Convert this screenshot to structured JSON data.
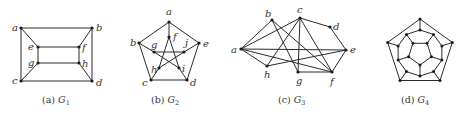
{
  "figure": {
    "panels": [
      {
        "id": "G1",
        "caption_prefix": "(a) ",
        "caption_graph": "G",
        "caption_sub": "1",
        "nodes": [
          {
            "id": "a",
            "x": 21,
            "y": 28,
            "lx": 12,
            "ly": 31
          },
          {
            "id": "b",
            "x": 92,
            "y": 28,
            "lx": 96,
            "ly": 31
          },
          {
            "id": "e",
            "x": 38,
            "y": 47,
            "lx": 28,
            "ly": 50
          },
          {
            "id": "f",
            "x": 79,
            "y": 47,
            "lx": 82,
            "ly": 51
          },
          {
            "id": "g",
            "x": 38,
            "y": 63,
            "lx": 28,
            "ly": 66
          },
          {
            "id": "h",
            "x": 79,
            "y": 63,
            "lx": 82,
            "ly": 67
          },
          {
            "id": "c",
            "x": 21,
            "y": 81,
            "lx": 12,
            "ly": 84
          },
          {
            "id": "d",
            "x": 92,
            "y": 81,
            "lx": 96,
            "ly": 86
          }
        ],
        "edges": [
          [
            "a",
            "b"
          ],
          [
            "a",
            "c"
          ],
          [
            "b",
            "d"
          ],
          [
            "c",
            "d"
          ],
          [
            "a",
            "e"
          ],
          [
            "b",
            "f"
          ],
          [
            "c",
            "g"
          ],
          [
            "d",
            "h"
          ],
          [
            "e",
            "f"
          ],
          [
            "g",
            "h"
          ],
          [
            "e",
            "g"
          ],
          [
            "f",
            "h"
          ]
        ],
        "caption_x": 42,
        "caption_y": 103
      },
      {
        "id": "G2",
        "caption_prefix": "(b) ",
        "caption_graph": "G",
        "caption_sub": "2",
        "nodes": [
          {
            "id": "a",
            "x": 169,
            "y": 22,
            "lx": 166,
            "ly": 15
          },
          {
            "id": "b",
            "x": 139,
            "y": 43,
            "lx": 130,
            "ly": 46
          },
          {
            "id": "e",
            "x": 199,
            "y": 43,
            "lx": 203,
            "ly": 47
          },
          {
            "id": "c",
            "x": 151,
            "y": 80,
            "lx": 142,
            "ly": 86
          },
          {
            "id": "d",
            "x": 187,
            "y": 80,
            "lx": 190,
            "ly": 86
          },
          {
            "id": "f",
            "x": 169,
            "y": 37,
            "lx": 173,
            "ly": 40
          },
          {
            "id": "j",
            "x": 184,
            "y": 52,
            "lx": 185,
            "ly": 46
          },
          {
            "id": "g",
            "x": 154,
            "y": 52,
            "lx": 151,
            "ly": 48
          },
          {
            "id": "h",
            "x": 159,
            "y": 68,
            "lx": 151,
            "ly": 73
          },
          {
            "id": "i",
            "x": 179,
            "y": 68,
            "lx": 182,
            "ly": 72
          }
        ],
        "edges": [
          [
            "a",
            "b"
          ],
          [
            "b",
            "c"
          ],
          [
            "c",
            "d"
          ],
          [
            "d",
            "e"
          ],
          [
            "e",
            "a"
          ],
          [
            "a",
            "f"
          ],
          [
            "b",
            "g"
          ],
          [
            "e",
            "j"
          ],
          [
            "c",
            "h"
          ],
          [
            "d",
            "i"
          ],
          [
            "f",
            "h"
          ],
          [
            "f",
            "i"
          ],
          [
            "g",
            "j"
          ],
          [
            "g",
            "i"
          ],
          [
            "h",
            "j"
          ]
        ],
        "caption_x": 151,
        "caption_y": 103
      },
      {
        "id": "G3",
        "caption_prefix": "(c) ",
        "caption_graph": "G",
        "caption_sub": "3",
        "nodes": [
          {
            "id": "a",
            "x": 241,
            "y": 49,
            "lx": 231,
            "ly": 53
          },
          {
            "id": "b",
            "x": 272,
            "y": 20,
            "lx": 265,
            "ly": 17
          },
          {
            "id": "c",
            "x": 300,
            "y": 18,
            "lx": 297,
            "ly": 13
          },
          {
            "id": "d",
            "x": 330,
            "y": 27,
            "lx": 333,
            "ly": 30
          },
          {
            "id": "e",
            "x": 346,
            "y": 50,
            "lx": 350,
            "ly": 53
          },
          {
            "id": "f",
            "x": 332,
            "y": 72,
            "lx": 330,
            "ly": 85
          },
          {
            "id": "g",
            "x": 298,
            "y": 72,
            "lx": 296,
            "ly": 84
          },
          {
            "id": "h",
            "x": 267,
            "y": 66,
            "lx": 264,
            "ly": 78
          }
        ],
        "edges": [
          [
            "a",
            "b"
          ],
          [
            "a",
            "c"
          ],
          [
            "a",
            "e"
          ],
          [
            "a",
            "h"
          ],
          [
            "a",
            "f"
          ],
          [
            "b",
            "g"
          ],
          [
            "b",
            "f"
          ],
          [
            "c",
            "h"
          ],
          [
            "c",
            "g"
          ],
          [
            "c",
            "f"
          ],
          [
            "c",
            "d"
          ],
          [
            "d",
            "e"
          ],
          [
            "e",
            "f"
          ],
          [
            "e",
            "h"
          ],
          [
            "g",
            "f"
          ]
        ],
        "caption_x": 278,
        "caption_y": 103
      },
      {
        "id": "G4",
        "caption_prefix": "(d) ",
        "caption_graph": "G",
        "caption_sub": "4",
        "caption_x": 401,
        "caption_y": 103
      }
    ]
  }
}
